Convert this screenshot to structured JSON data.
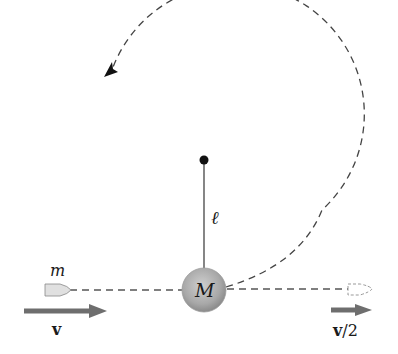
{
  "diagram": {
    "labels": {
      "bullet_mass": "m",
      "bob_mass": "M",
      "rod_length": "ℓ",
      "initial_velocity": "v",
      "final_velocity_vec": "v",
      "final_velocity_rest": "/2"
    },
    "colors": {
      "line": "#333333",
      "dash": "#444444",
      "bob_fill_center": "#c8c8c8",
      "bob_fill_edge": "#8c8c8c",
      "arrow_fill": "#6e6e6e",
      "bullet_fill": "#e0e0e0",
      "pivot": "#111111"
    }
  }
}
